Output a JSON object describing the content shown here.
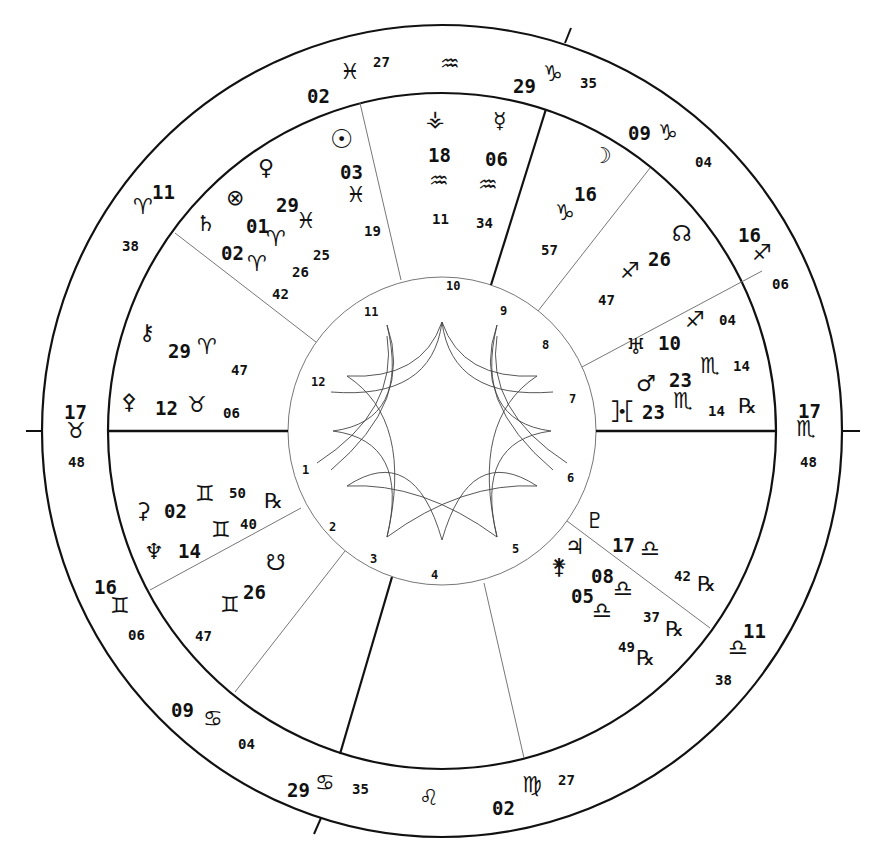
{
  "chart": {
    "center": {
      "x": 442,
      "y": 431
    },
    "radii": {
      "outer": 402,
      "zodiac_inner": 336,
      "house_ring": 154
    }
  },
  "cusps": [
    {
      "house": 1,
      "deg": "17",
      "sign": "♉",
      "sign_name": "Taurus",
      "min": "48"
    },
    {
      "house": 2,
      "deg": "16",
      "sign": "♊",
      "sign_name": "Gemini",
      "min": "06"
    },
    {
      "house": 3,
      "deg": "09",
      "sign": "♋",
      "sign_name": "Cancer",
      "min": "04"
    },
    {
      "house": 4,
      "deg": "29",
      "sign": "♋",
      "sign_name": "Cancer",
      "min": "35"
    },
    {
      "house": 5,
      "deg": "02",
      "sign": "♍",
      "sign_name": "Virgo",
      "min": "27"
    },
    {
      "house": 6,
      "deg": "11",
      "sign": "♎",
      "sign_name": "Libra",
      "min": "38"
    },
    {
      "house": 7,
      "deg": "17",
      "sign": "♏",
      "sign_name": "Scorpio",
      "min": "48"
    },
    {
      "house": 8,
      "deg": "16",
      "sign": "♐",
      "sign_name": "Sagittarius",
      "min": "06"
    },
    {
      "house": 9,
      "deg": "09",
      "sign": "♑",
      "sign_name": "Capricorn",
      "min": "04"
    },
    {
      "house": 10,
      "deg": "29",
      "sign": "♑",
      "sign_name": "Capricorn",
      "min": "35"
    },
    {
      "house": 11,
      "deg": "02",
      "sign": "♓",
      "sign_name": "Pisces",
      "min": "27"
    },
    {
      "house": 12,
      "deg": "11",
      "sign": "♈",
      "sign_name": "Aries",
      "min": "38"
    }
  ],
  "intercepted": [
    {
      "sign": "♒",
      "sign_name": "Aquarius"
    },
    {
      "sign": "♌",
      "sign_name": "Leo"
    }
  ],
  "planets": [
    {
      "name": "Sun",
      "glyph": "☉",
      "deg": "03",
      "sign": "♓",
      "min": "19",
      "retro": ""
    },
    {
      "name": "Venus",
      "glyph": "♀",
      "deg": "29",
      "sign": "♓",
      "min": "25",
      "retro": ""
    },
    {
      "name": "Part of Fortune",
      "glyph": "⊗",
      "deg": "01",
      "sign": "♈",
      "min": "26",
      "retro": ""
    },
    {
      "name": "Saturn",
      "glyph": "♄",
      "deg": "02",
      "sign": "♈",
      "min": "42",
      "retro": ""
    },
    {
      "name": "Vesta",
      "glyph": "⚶",
      "deg": "18",
      "sign": "♒",
      "min": "11",
      "retro": ""
    },
    {
      "name": "Mercury",
      "glyph": "☿",
      "deg": "06",
      "sign": "♒",
      "min": "34",
      "retro": ""
    },
    {
      "name": "Moon",
      "glyph": "☽",
      "deg": "16",
      "sign": "♑",
      "min": "57",
      "retro": ""
    },
    {
      "name": "North Node",
      "glyph": "☊",
      "deg": "26",
      "sign": "♐",
      "min": "47",
      "retro": ""
    },
    {
      "name": "Uranus",
      "glyph": "♅",
      "deg": "10",
      "sign": "♐",
      "min": "04",
      "retro": ""
    },
    {
      "name": "Mars",
      "glyph": "♂",
      "deg": "23",
      "sign": "♏",
      "min": "14",
      "retro": ""
    },
    {
      "name": "Proserpina",
      "glyph": "⯘",
      "deg": "23",
      "sign": "♏",
      "min": "14",
      "retro": "℞"
    },
    {
      "name": "Pluto",
      "glyph": "♇",
      "deg": "17",
      "sign": "♎",
      "min": "42",
      "retro": "℞"
    },
    {
      "name": "Jupiter",
      "glyph": "♃",
      "deg": "08",
      "sign": "♎",
      "min": "37",
      "retro": "℞"
    },
    {
      "name": "Juno",
      "glyph": "⚵",
      "deg": "05",
      "sign": "♎",
      "min": "49",
      "retro": "℞"
    },
    {
      "name": "Chiron",
      "glyph": "⚷",
      "deg": "29",
      "sign": "♈",
      "min": "47",
      "retro": ""
    },
    {
      "name": "Pallas",
      "glyph": "⚴",
      "deg": "12",
      "sign": "♉",
      "min": "06",
      "retro": ""
    },
    {
      "name": "Ceres",
      "glyph": "⚳",
      "deg": "02",
      "sign": "♊",
      "min": "50",
      "retro": "℞"
    },
    {
      "name": "Neptune",
      "glyph": "♆",
      "deg": "14",
      "sign": "♊",
      "min": "40",
      "retro": ""
    },
    {
      "name": "South Node",
      "glyph": "☋",
      "deg": "26",
      "sign": "♊",
      "min": "47",
      "retro": ""
    }
  ],
  "house_numbers": [
    "1",
    "2",
    "3",
    "4",
    "5",
    "6",
    "7",
    "8",
    "9",
    "10",
    "11",
    "12"
  ],
  "colors": {
    "ink": "#111111",
    "thin": "#777777",
    "background": "#ffffff"
  }
}
